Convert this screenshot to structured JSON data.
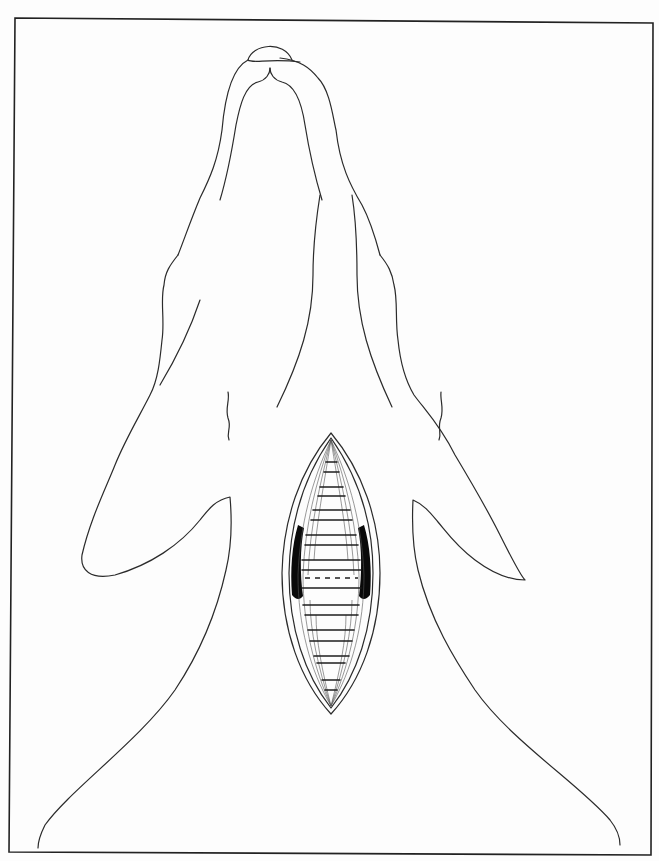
{
  "figure": {
    "title": "Ventral view, surgical approach to cervical trachea",
    "type": "anatomical line illustration",
    "colors": {
      "line": "#2b2b2b",
      "frame": "#222222",
      "dark_fill": "#0a0a0a",
      "background": "#fdfdfd"
    },
    "elements": [
      {
        "name": "frame",
        "label": "figure border"
      },
      {
        "name": "head-outline",
        "label": "head and mandible outline"
      },
      {
        "name": "nose-cap",
        "label": "chin / rostral mandible"
      },
      {
        "name": "mandible-inner",
        "label": "inner mandibular lines"
      },
      {
        "name": "neck-muscle-lines",
        "label": "sternohyoid / cervical muscle borders"
      },
      {
        "name": "forelimb-left",
        "label": "left forelimb"
      },
      {
        "name": "forelimb-right",
        "label": "right forelimb"
      },
      {
        "name": "incision",
        "label": "ventral midline incision"
      },
      {
        "name": "retracted-muscles",
        "label": "retracted sternohyoid muscles"
      },
      {
        "name": "tracheal-rings",
        "label": "tracheal rings"
      },
      {
        "name": "incision-line",
        "label": "planned tracheotomy (dashed)"
      }
    ]
  }
}
